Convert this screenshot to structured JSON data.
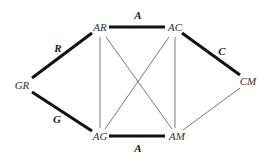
{
  "diagram": {
    "nodes": [
      {
        "id": "AR",
        "label": "AR",
        "x": 100,
        "y": 27
      },
      {
        "id": "AC",
        "label": "AC",
        "x": 175,
        "y": 27
      },
      {
        "id": "GR",
        "label": "GR",
        "x": 22,
        "y": 85
      },
      {
        "id": "CM",
        "label": "CM",
        "x": 248,
        "y": 81
      },
      {
        "id": "AG",
        "label": "AG",
        "x": 100,
        "y": 136
      },
      {
        "id": "AM",
        "label": "AM",
        "x": 177,
        "y": 136
      }
    ],
    "edges": [
      {
        "from": "AR",
        "to": "AC",
        "label": "A",
        "bold": true,
        "x1": 109,
        "y1": 27,
        "x2": 165,
        "y2": 27,
        "lx": 138,
        "ly": 15
      },
      {
        "from": "GR",
        "to": "AR",
        "label": "R",
        "bold": true,
        "x1": 32,
        "y1": 78,
        "x2": 92,
        "y2": 33,
        "lx": 58,
        "ly": 48
      },
      {
        "from": "AC",
        "to": "CM",
        "label": "C",
        "bold": true,
        "x1": 182,
        "y1": 33,
        "x2": 240,
        "y2": 75,
        "lx": 222,
        "ly": 51
      },
      {
        "from": "GR",
        "to": "AG",
        "label": "G",
        "bold": true,
        "x1": 32,
        "y1": 92,
        "x2": 92,
        "y2": 131,
        "lx": 57,
        "ly": 119
      },
      {
        "from": "AG",
        "to": "AM",
        "label": "A",
        "bold": true,
        "x1": 109,
        "y1": 136,
        "x2": 165,
        "y2": 136,
        "lx": 138,
        "ly": 148
      },
      {
        "from": "AR",
        "to": "AG",
        "label": "",
        "bold": false,
        "x1": 100,
        "y1": 37,
        "x2": 100,
        "y2": 128
      },
      {
        "from": "AC",
        "to": "AM",
        "label": "",
        "bold": false,
        "x1": 175,
        "y1": 37,
        "x2": 175,
        "y2": 128
      },
      {
        "from": "AR",
        "to": "AM",
        "label": "",
        "bold": false,
        "x1": 106,
        "y1": 37,
        "x2": 172,
        "y2": 129
      },
      {
        "from": "AC",
        "to": "AG",
        "label": "",
        "bold": false,
        "x1": 169,
        "y1": 37,
        "x2": 105,
        "y2": 129
      },
      {
        "from": "AM",
        "to": "CM",
        "label": "",
        "bold": false,
        "x1": 183,
        "y1": 130,
        "x2": 240,
        "y2": 88
      }
    ]
  }
}
